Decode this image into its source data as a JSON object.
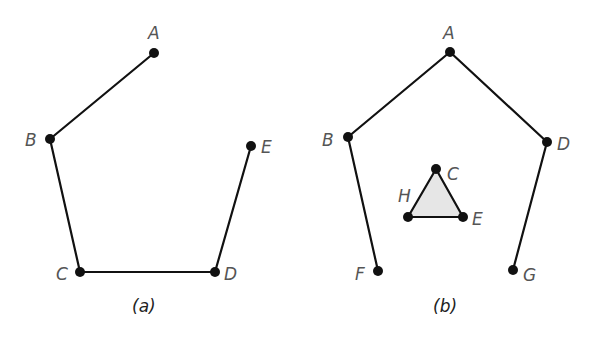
{
  "figure": {
    "panels": [
      {
        "id": "a",
        "caption": "(a)",
        "nodes": [
          {
            "id": "A",
            "label": "A",
            "x": 154,
            "y": 53
          },
          {
            "id": "B",
            "label": "B",
            "x": 50,
            "y": 139
          },
          {
            "id": "C",
            "label": "C",
            "x": 80,
            "y": 272
          },
          {
            "id": "D",
            "label": "D",
            "x": 215,
            "y": 272
          },
          {
            "id": "E",
            "label": "E",
            "x": 251,
            "y": 146
          }
        ],
        "edges": [
          [
            "A",
            "B"
          ],
          [
            "B",
            "C"
          ],
          [
            "C",
            "D"
          ],
          [
            "D",
            "E"
          ]
        ]
      },
      {
        "id": "b",
        "caption": "(b)",
        "nodes": [
          {
            "id": "A",
            "label": "A",
            "x": 450,
            "y": 52
          },
          {
            "id": "B",
            "label": "B",
            "x": 348,
            "y": 137
          },
          {
            "id": "D",
            "label": "D",
            "x": 547,
            "y": 142
          },
          {
            "id": "F",
            "label": "F",
            "x": 378,
            "y": 271
          },
          {
            "id": "G",
            "label": "G",
            "x": 513,
            "y": 270
          },
          {
            "id": "C",
            "label": "C",
            "x": 436,
            "y": 169
          },
          {
            "id": "H",
            "label": "H",
            "x": 408,
            "y": 217
          },
          {
            "id": "E",
            "label": "E",
            "x": 463,
            "y": 217
          }
        ],
        "edges": [
          [
            "A",
            "B"
          ],
          [
            "A",
            "D"
          ],
          [
            "B",
            "F"
          ],
          [
            "D",
            "G"
          ],
          [
            "C",
            "H"
          ],
          [
            "H",
            "E"
          ],
          [
            "E",
            "C"
          ]
        ],
        "shaded_triangle": [
          "C",
          "H",
          "E"
        ],
        "triangle_fill": "#e6e6e6"
      }
    ]
  }
}
